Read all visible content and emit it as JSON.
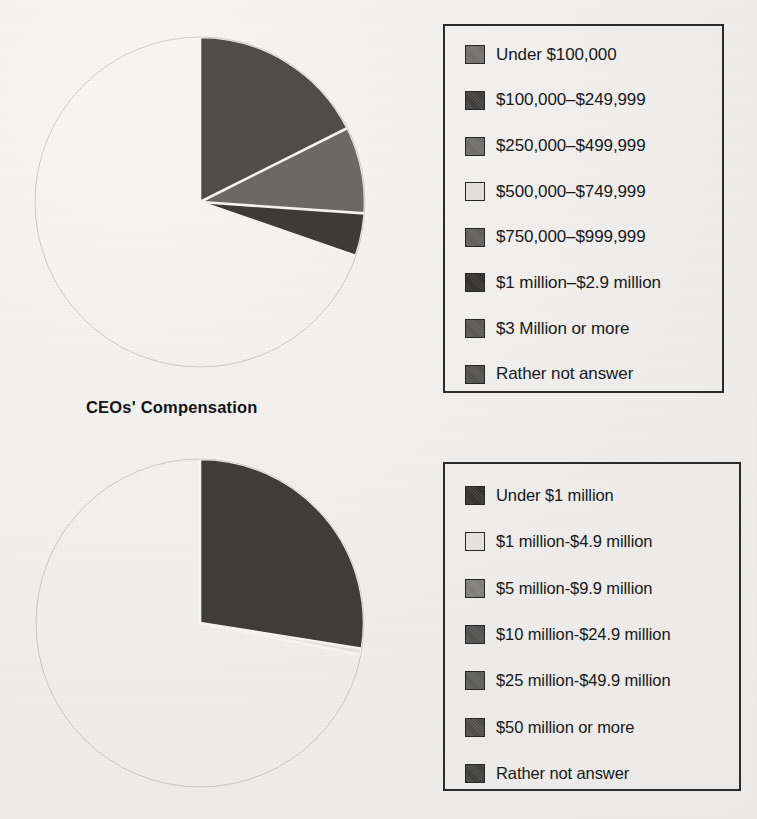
{
  "title": "CEOs' Compensation",
  "colors": {
    "g_light": "#eceae6",
    "g_lightgray": "#b9b8b6",
    "g_mid": "#8e8d8b",
    "g_mid2": "#7d7c7a",
    "g_dark": "#585756",
    "g_darker": "#4a4948",
    "g_darkest": "#363534",
    "g_black": "#2a2928",
    "outline": "#2b2b2b"
  },
  "legends": [
    {
      "name": "ceo-compensation-legend",
      "items": [
        {
          "label": "Under $100,000",
          "color": "#6e6d6b"
        },
        {
          "label": "$100,000–$249,999",
          "color": "#3c3b3a"
        },
        {
          "label": "$250,000–$499,999",
          "color": "#6a6967"
        },
        {
          "label": "$500,000–$749,999",
          "color": "#dedcd8"
        },
        {
          "label": "$750,000–$999,999",
          "color": "#5d5c5a"
        },
        {
          "label": "$1 million–$2.9 million",
          "color": "#2e2d2c"
        },
        {
          "label": "$3 Million or more",
          "color": "#55544f"
        },
        {
          "label": "Rather not answer",
          "color": "#4e4d4b"
        }
      ]
    },
    {
      "name": "company-revenue-legend",
      "items": [
        {
          "label": "Under $1 million",
          "color": "#302f2e"
        },
        {
          "label": "$1 million-$4.9 million",
          "color": "#e2e0dc"
        },
        {
          "label": "$5 million-$9.9 million",
          "color": "#7c7b79"
        },
        {
          "label": "$10 million-$24.9 million",
          "color": "#4e4d4c"
        },
        {
          "label": "$25 million-$49.9 million",
          "color": "#5a5957"
        },
        {
          "label": "$50 million or more",
          "color": "#4a4947"
        },
        {
          "label": "Rather not answer",
          "color": "#3e3d3c"
        }
      ]
    }
  ],
  "chart_data": [
    {
      "type": "pie",
      "id": "ceo-compensation-pie",
      "title": "CEOs' Compensation",
      "start_angle_deg": 0,
      "direction": "clockwise",
      "categories": [
        "Under $100,000",
        "$100,000–$249,999",
        "$250,000–$499,999",
        "$500,000–$749,999",
        "$750,000–$999,999",
        "$1 million–$2.9 million",
        "$3 Million or more",
        "Rather not answer"
      ],
      "values": [
        5.4,
        30.3,
        26.1,
        7.5,
        5.0,
        7.2,
        0.9,
        17.6
      ],
      "unit": "percent",
      "colors": [
        "#6e6d6b",
        "#3c3b3a",
        "#6a6967",
        "#dedcd8",
        "#5d5c5a",
        "#2e2d2c",
        "#55544f",
        "#4e4d4b"
      ],
      "legend_position": "right",
      "labels_on_slices": false
    },
    {
      "type": "pie",
      "id": "company-revenue-pie",
      "title": "",
      "start_angle_deg": 0,
      "direction": "clockwise",
      "categories": [
        "Under $1 million",
        "$1 million-$4.9 million",
        "$5 million-$9.9 million",
        "$10 million-$24.9 million",
        "$25 million-$49.9 million",
        "$50 million or more",
        "Rather not answer"
      ],
      "values": [
        11.1,
        28.1,
        12.5,
        17.2,
        1.9,
        1.7,
        27.5
      ],
      "unit": "percent",
      "colors": [
        "#302f2e",
        "#e2e0dc",
        "#7c7b79",
        "#4e4d4c",
        "#5a5957",
        "#4a4947",
        "#3e3d3c"
      ],
      "legend_position": "right",
      "labels_on_slices": false
    }
  ]
}
